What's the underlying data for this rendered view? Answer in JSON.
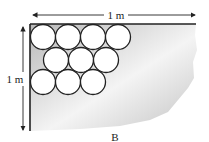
{
  "figure": {
    "label": "B",
    "width_dimension": "1 m",
    "height_dimension": "1 m",
    "circles": {
      "rows": [
        {
          "count": 4,
          "cy": 37,
          "cx": [
            43,
            68,
            93,
            118
          ]
        },
        {
          "count": 3,
          "cy": 60,
          "cx": [
            56,
            81,
            106
          ]
        },
        {
          "count": 3,
          "cy": 82,
          "cx": [
            43,
            68,
            93
          ]
        }
      ],
      "radius": 12.5
    },
    "colors": {
      "shade": "#c8c8c8",
      "line": "#222222",
      "circle_fill": "#ffffff"
    }
  }
}
